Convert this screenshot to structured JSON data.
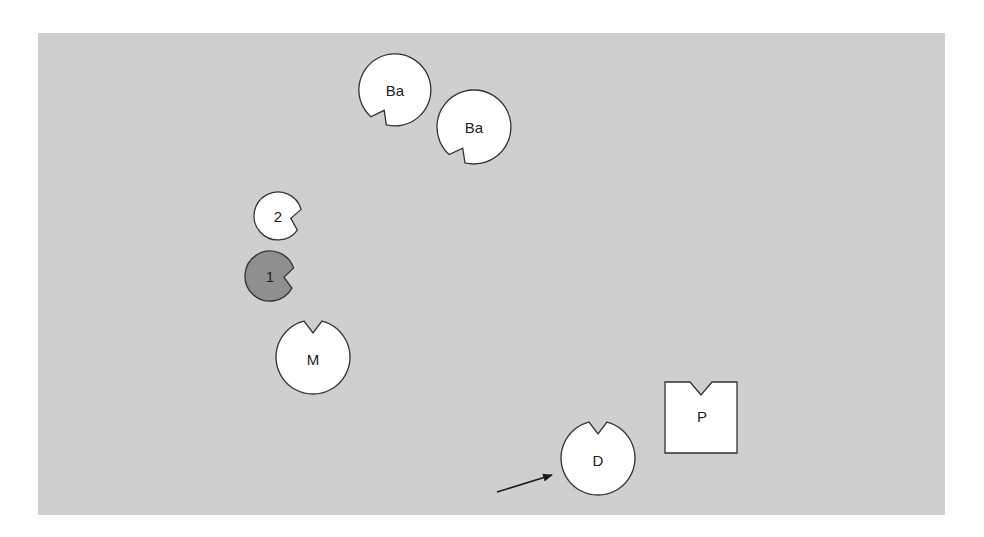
{
  "figure": {
    "background_color": "#cfcfcf",
    "shape_fill": "#ffffff",
    "shape_stroke": "#333333",
    "highlight_fill": "#8f8f8f",
    "shapes": [
      {
        "id": "ba-1",
        "label": "Ba",
        "kind": "notched-circle",
        "highlighted": false
      },
      {
        "id": "ba-2",
        "label": "Ba",
        "kind": "notched-circle",
        "highlighted": false
      },
      {
        "id": "two",
        "label": "2",
        "kind": "notched-circle",
        "highlighted": false
      },
      {
        "id": "one",
        "label": "1",
        "kind": "notched-circle",
        "highlighted": true
      },
      {
        "id": "m",
        "label": "M",
        "kind": "notched-circle",
        "highlighted": false
      },
      {
        "id": "d",
        "label": "D",
        "kind": "notched-circle",
        "highlighted": false,
        "pointed_by_arrow": true
      },
      {
        "id": "p",
        "label": "P",
        "kind": "notched-square",
        "highlighted": false
      }
    ],
    "arrow": {
      "target": "d",
      "color": "#1a1a1a"
    }
  }
}
